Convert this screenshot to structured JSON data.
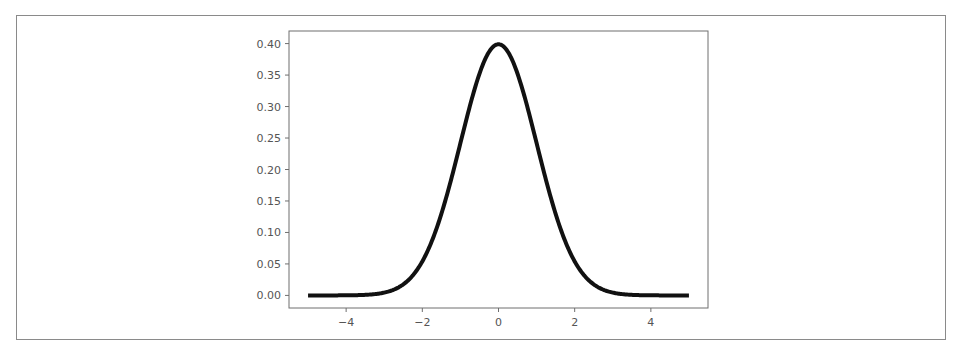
{
  "chart_data": {
    "type": "line",
    "title": "",
    "xlabel": "",
    "ylabel": "",
    "xlim": [
      -5.5,
      5.5
    ],
    "ylim": [
      -0.02,
      0.42
    ],
    "grid": false,
    "legend": null,
    "x_ticks": [
      -4,
      -2,
      0,
      2,
      4
    ],
    "x_tick_labels": [
      "−4",
      "−2",
      "0",
      "2",
      "4"
    ],
    "y_ticks": [
      0.0,
      0.05,
      0.1,
      0.15,
      0.2,
      0.25,
      0.3,
      0.35,
      0.4
    ],
    "y_tick_labels": [
      "0.00",
      "0.05",
      "0.10",
      "0.15",
      "0.20",
      "0.25",
      "0.30",
      "0.35",
      "0.40"
    ],
    "series": [
      {
        "name": "standard normal pdf",
        "color": "#111111",
        "line_width": 4,
        "function": "exp(-x^2/2)/sqrt(2*pi)",
        "x_range": [
          -5,
          5
        ],
        "x": [
          -5,
          -4,
          -3,
          -2.5,
          -2,
          -1.5,
          -1,
          -0.5,
          0,
          0.5,
          1,
          1.5,
          2,
          2.5,
          3,
          4,
          5
        ],
        "y": [
          1.5e-06,
          0.00013,
          0.0044,
          0.0175,
          0.054,
          0.1295,
          0.242,
          0.352,
          0.3989,
          0.352,
          0.242,
          0.1295,
          0.054,
          0.0175,
          0.0044,
          0.00013,
          1.5e-06
        ]
      }
    ]
  }
}
